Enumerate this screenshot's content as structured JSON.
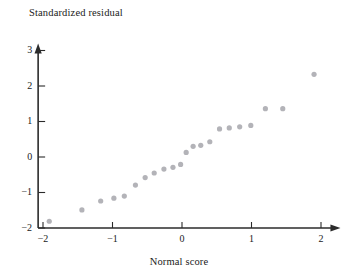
{
  "chart_data": {
    "type": "scatter",
    "title": "",
    "xlabel": "Normal score",
    "ylabel": "Standardized residual",
    "xlim": [
      -2.25,
      2.3
    ],
    "ylim": [
      -2.0,
      3.2
    ],
    "xticks": [
      -2,
      -1,
      0,
      1,
      2
    ],
    "xtick_labels": [
      "−2",
      "−1",
      "0",
      "1",
      "2"
    ],
    "yticks": [
      -2,
      -1,
      0,
      1,
      2,
      3
    ],
    "ytick_labels": [
      "−2",
      "−1",
      "0",
      "1",
      "2",
      "3"
    ],
    "grid": false,
    "legend": null,
    "marker_color": "#b3b3b8",
    "axis_color": "#2b2b2b",
    "points": [
      {
        "x": -1.91,
        "y": -1.81
      },
      {
        "x": -1.44,
        "y": -1.49
      },
      {
        "x": -1.17,
        "y": -1.24
      },
      {
        "x": -0.98,
        "y": -1.16
      },
      {
        "x": -0.83,
        "y": -1.1
      },
      {
        "x": -0.67,
        "y": -0.79
      },
      {
        "x": -0.53,
        "y": -0.58
      },
      {
        "x": -0.4,
        "y": -0.45
      },
      {
        "x": -0.26,
        "y": -0.34
      },
      {
        "x": -0.13,
        "y": -0.29
      },
      {
        "x": -0.02,
        "y": -0.21
      },
      {
        "x": 0.06,
        "y": 0.13
      },
      {
        "x": 0.16,
        "y": 0.3
      },
      {
        "x": 0.27,
        "y": 0.33
      },
      {
        "x": 0.4,
        "y": 0.43
      },
      {
        "x": 0.54,
        "y": 0.79
      },
      {
        "x": 0.68,
        "y": 0.82
      },
      {
        "x": 0.83,
        "y": 0.85
      },
      {
        "x": 0.99,
        "y": 0.89
      },
      {
        "x": 1.2,
        "y": 1.36
      },
      {
        "x": 1.45,
        "y": 1.36
      },
      {
        "x": 1.9,
        "y": 2.33
      }
    ]
  },
  "labels": {
    "y_axis_title": "Standardized residual",
    "x_axis_title": "Normal score"
  }
}
